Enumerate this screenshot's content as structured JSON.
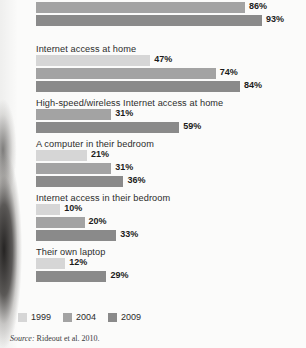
{
  "chart_data": {
    "type": "bar",
    "orientation": "horizontal",
    "title": "",
    "xlabel": "",
    "ylabel": "",
    "xlim": [
      0,
      100
    ],
    "grid": false,
    "value_suffix": "%",
    "legend_position": "bottom-left",
    "series": [
      {
        "name": "1999",
        "color": "#d6d6d6"
      },
      {
        "name": "2004",
        "color": "#a3a3a3"
      },
      {
        "name": "2009",
        "color": "#8a8a8a"
      }
    ],
    "categories": [
      "(label cut off at top of image)",
      "Internet access at home",
      "High-speed/wireless Internet access at home",
      "A computer in their bedroom",
      "Internet access in their bedroom",
      "Their own laptop"
    ],
    "groups": [
      {
        "label": "(label cut off at top of image)",
        "label_visible": false,
        "bars": [
          {
            "series": "1999",
            "value": 73,
            "value_label": "73%"
          },
          {
            "series": "2004",
            "value": 86,
            "value_label": "86%"
          },
          {
            "series": "2009",
            "value": 93,
            "value_label": "93%"
          }
        ]
      },
      {
        "label": "Internet access at home",
        "label_visible": true,
        "bars": [
          {
            "series": "1999",
            "value": 47,
            "value_label": "47%"
          },
          {
            "series": "2004",
            "value": 74,
            "value_label": "74%"
          },
          {
            "series": "2009",
            "value": 84,
            "value_label": "84%"
          }
        ]
      },
      {
        "label": "High-speed/wireless Internet access at home",
        "label_visible": true,
        "bars": [
          {
            "series": "2004",
            "value": 31,
            "value_label": "31%"
          },
          {
            "series": "2009",
            "value": 59,
            "value_label": "59%"
          }
        ]
      },
      {
        "label": "A computer in their bedroom",
        "label_visible": true,
        "bars": [
          {
            "series": "1999",
            "value": 21,
            "value_label": "21%"
          },
          {
            "series": "2004",
            "value": 31,
            "value_label": "31%"
          },
          {
            "series": "2009",
            "value": 36,
            "value_label": "36%"
          }
        ]
      },
      {
        "label": "Internet access in their bedroom",
        "label_visible": true,
        "bars": [
          {
            "series": "1999",
            "value": 10,
            "value_label": "10%"
          },
          {
            "series": "2004",
            "value": 20,
            "value_label": "20%"
          },
          {
            "series": "2009",
            "value": 33,
            "value_label": "33%"
          }
        ]
      },
      {
        "label": "Their own laptop",
        "label_visible": true,
        "bars": [
          {
            "series": "1999",
            "value": 12,
            "value_label": "12%"
          },
          {
            "series": "2009",
            "value": 29,
            "value_label": "29%"
          }
        ]
      }
    ],
    "legend": [
      {
        "label": "1999",
        "color": "#d6d6d6"
      },
      {
        "label": "2004",
        "color": "#a3a3a3"
      },
      {
        "label": "2009",
        "color": "#8a8a8a"
      }
    ]
  },
  "source": {
    "prefix": "Source:",
    "text": "Rideout et al. 2010."
  }
}
